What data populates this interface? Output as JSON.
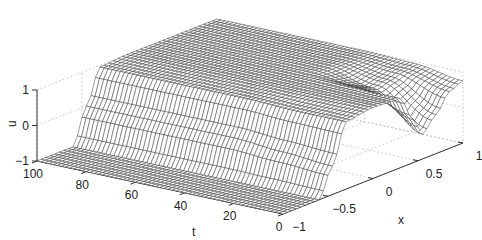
{
  "chart_data": {
    "type": "surface",
    "title": "",
    "xlabel": "x",
    "ylabel": "t",
    "zlabel": "u",
    "x_ticks": [
      "-1",
      "-0.5",
      "0",
      "0.5",
      "1"
    ],
    "x_tick_values": [
      -1,
      -0.5,
      0,
      0.5,
      1
    ],
    "t_ticks": [
      "100",
      "80",
      "60",
      "40",
      "20",
      "0"
    ],
    "t_tick_values": [
      100,
      80,
      60,
      40,
      20,
      0
    ],
    "z_ticks": [
      "1",
      "0",
      "-1"
    ],
    "z_tick_values": [
      1,
      0,
      -1
    ],
    "xlim": [
      -1,
      1
    ],
    "tlim": [
      0,
      100
    ],
    "zlim": [
      -1,
      1
    ],
    "grid": true,
    "mesh_color": "#2a2a2a",
    "face_color": "#ffffff",
    "profiles": [
      {
        "t": 0,
        "x": [
          -1,
          -0.6,
          -0.45,
          -0.3,
          0,
          0.3,
          0.45,
          0.55,
          0.7,
          0.85,
          1
        ],
        "u": [
          -1,
          -1,
          -0.2,
          0.9,
          1,
          0.95,
          0.2,
          -0.3,
          0.1,
          0.6,
          0.75
        ]
      },
      {
        "t": 20,
        "x": [
          -1,
          -0.6,
          -0.45,
          -0.3,
          0,
          0.3,
          0.45,
          0.55,
          0.7,
          0.85,
          1
        ],
        "u": [
          -1,
          -1,
          -0.1,
          0.9,
          1,
          0.98,
          0.8,
          0.7,
          0.8,
          0.9,
          0.95
        ]
      },
      {
        "t": 40,
        "x": [
          -1,
          -0.6,
          -0.45,
          -0.3,
          0,
          0.3,
          0.45,
          0.55,
          0.7,
          0.85,
          1
        ],
        "u": [
          -1,
          -1,
          0,
          0.95,
          1,
          1,
          1,
          1,
          1,
          1,
          1
        ]
      },
      {
        "t": 100,
        "x": [
          -1,
          -0.6,
          -0.45,
          -0.3,
          0,
          0.3,
          0.45,
          0.55,
          0.7,
          0.85,
          1
        ],
        "u": [
          -1,
          -1,
          0,
          0.95,
          1,
          1,
          1,
          1,
          1,
          1,
          1
        ]
      }
    ]
  },
  "labels": {
    "x_axis": "x",
    "t_axis": "t",
    "u_axis": "u"
  }
}
